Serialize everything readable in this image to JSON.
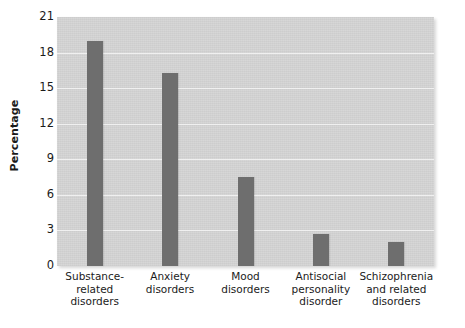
{
  "chart_data": {
    "type": "bar",
    "title": "",
    "subtitle": "",
    "xlabel": "",
    "ylabel": "Percentage",
    "categories": [
      "Substance-\nrelated\ndisorders",
      "Anxiety\ndisorders",
      "Mood\ndisorders",
      "Antisocial\npersonality\ndisorder",
      "Schizophrenia\nand related\ndisorders"
    ],
    "values": [
      19.0,
      16.3,
      7.5,
      2.7,
      2.0
    ],
    "ylim": [
      0,
      21
    ],
    "yticks": [
      0,
      3,
      6,
      9,
      12,
      15,
      18,
      21
    ],
    "ytick_labels": [
      "0",
      "3",
      "6",
      "9",
      "12",
      "15",
      "18",
      "21"
    ],
    "grid": true,
    "legend": "none",
    "colors": {
      "bar": "#6e6e6e",
      "plot_background": "#d4d4d4",
      "gridline": "#f0f0f0",
      "figure_background": "#ffffff",
      "text": "#1b1b1b"
    }
  }
}
